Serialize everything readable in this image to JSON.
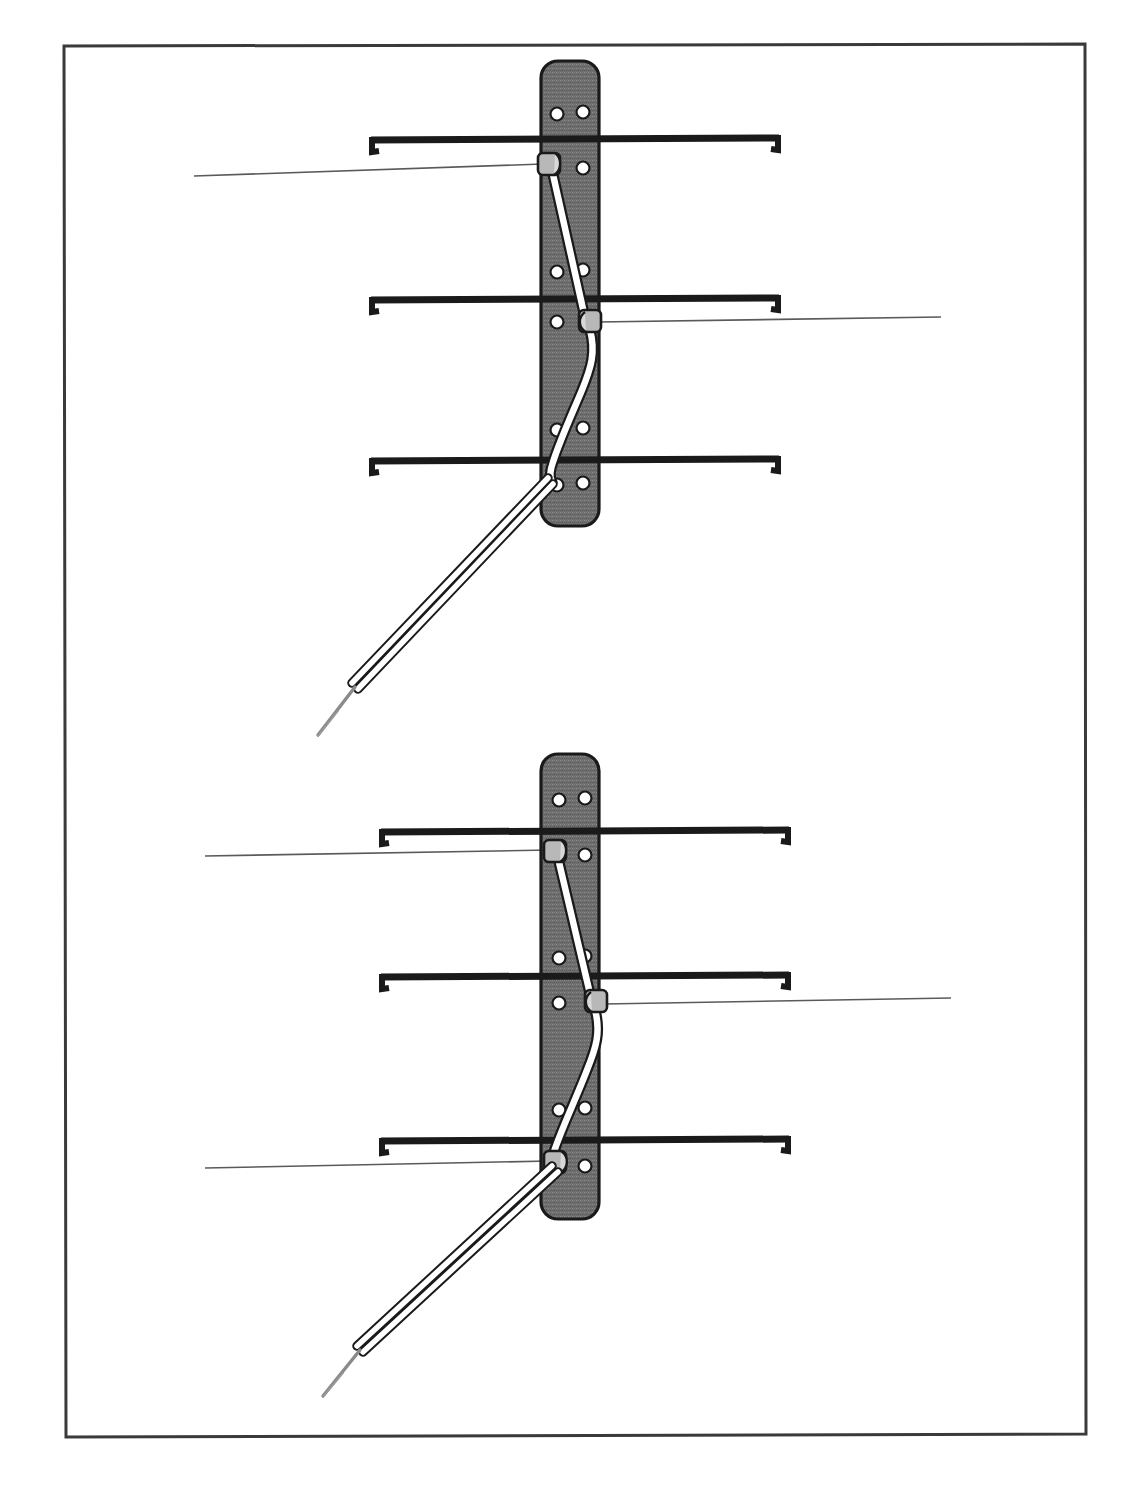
{
  "figure": {
    "caption_fragment": "",
    "border": {
      "color": "#3a3a3a",
      "x": 63,
      "y": 45,
      "width": 1022,
      "height": 1390,
      "stroke_width": 3
    },
    "colors": {
      "plate_fill": "#6e6e6e",
      "plate_stroke": "#1a1a1a",
      "hole_fill": "#ffffff",
      "hole_stroke": "#1a1a1a",
      "wire_black": "#1a1a1a",
      "suture_white": "#ffffff",
      "suture_stroke": "#1a1a1a",
      "knot_fill": "#b8b8b8",
      "leader_line": "#5a5a5a",
      "needle_gray": "#8a8a8a",
      "background": "#ffffff"
    },
    "panels": [
      {
        "id": "upper-panel",
        "name": "Upper illustration: suture exits free through distal plate hole",
        "plate": {
          "x": 541,
          "y": 61,
          "width": 58,
          "height": 465,
          "corner_radius": 16,
          "hole_rows": [
            114,
            272,
            430,
            485
          ],
          "hole_columns": [
            557,
            583
          ],
          "hole_radius": 6.5,
          "hole_count": 8
        },
        "wires": [
          {
            "id": "wire-proximal",
            "y": 140,
            "x_left": 371,
            "x_right": 779,
            "thickness": 7
          },
          {
            "id": "wire-middle",
            "y": 300,
            "x_left": 371,
            "x_right": 779,
            "thickness": 7
          },
          {
            "id": "wire-distal",
            "y": 461,
            "x_left": 371,
            "x_right": 779,
            "thickness": 7
          }
        ],
        "knots": [
          {
            "id": "knot-proximal-left",
            "x": 548,
            "y": 163,
            "label_side": "left"
          },
          {
            "id": "knot-middle-right",
            "x": 589,
            "y": 320,
            "label_side": "right"
          }
        ],
        "leaders": [
          {
            "id": "leader-upper-1",
            "x1": 194,
            "y1": 176,
            "x2": 540,
            "y2": 164
          },
          {
            "id": "leader-upper-2",
            "x1": 597,
            "y1": 322,
            "x2": 941,
            "y2": 320
          }
        ],
        "needle": {
          "id": "needle-upper",
          "strand_start_x": 552,
          "strand_start_y": 480,
          "strand_end_x": 357,
          "strand_end_y": 686,
          "tip_end_x": 318,
          "tip_end_y": 735
        }
      },
      {
        "id": "lower-panel",
        "name": "Lower illustration: suture tied at distal plate hole with third knot",
        "plate": {
          "x": 541,
          "y": 754,
          "width": 58,
          "height": 465,
          "corner_radius": 16,
          "hole_rows": [
            800,
            958,
            1110,
            1163
          ],
          "hole_columns": [
            557,
            583
          ],
          "hole_radius": 6.5,
          "hole_count": 8
        },
        "wires": [
          {
            "id": "wire-proximal",
            "y": 832,
            "x_left": 381,
            "x_right": 789,
            "thickness": 7
          },
          {
            "id": "wire-middle",
            "y": 977,
            "x_left": 381,
            "x_right": 789,
            "thickness": 7
          },
          {
            "id": "wire-distal",
            "y": 1141,
            "x_left": 381,
            "x_right": 789,
            "thickness": 7
          }
        ],
        "knots": [
          {
            "id": "knot-proximal-left",
            "x": 554,
            "y": 850,
            "label_side": "left"
          },
          {
            "id": "knot-middle-right",
            "x": 594,
            "y": 1000,
            "label_side": "right"
          },
          {
            "id": "knot-distal-left",
            "x": 554,
            "y": 1160,
            "label_side": "left"
          }
        ],
        "leaders": [
          {
            "id": "leader-lower-1",
            "x1": 205,
            "y1": 856,
            "x2": 546,
            "y2": 851
          },
          {
            "id": "leader-lower-2",
            "x1": 602,
            "y1": 1004,
            "x2": 951,
            "y2": 999
          },
          {
            "id": "leader-lower-3",
            "x1": 205,
            "y1": 1168,
            "x2": 546,
            "y2": 1161
          }
        ],
        "needle": {
          "id": "needle-lower",
          "strand_start_x": 556,
          "strand_start_y": 1172,
          "strand_end_x": 362,
          "strand_end_y": 1350,
          "tip_end_x": 323,
          "tip_end_y": 1395
        }
      }
    ]
  }
}
